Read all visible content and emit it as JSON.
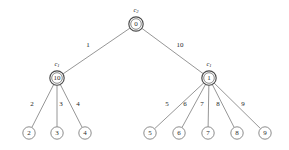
{
  "diagram": {
    "type": "weighted-tree",
    "background_color": "#ffffff",
    "edge_color": "#8a8a8a",
    "node_stroke_color": "#4a4a4a",
    "text_color": "#1e1e1e",
    "nodes": [
      {
        "id": "root",
        "label": "0",
        "x": 136,
        "y": 24,
        "r": 7.2,
        "style": "double",
        "cluster": "c",
        "cluster_sub": "2",
        "cluster_x": 136,
        "cluster_y": 9
      },
      {
        "id": "left",
        "label": "10",
        "x": 57,
        "y": 78,
        "r": 7.2,
        "style": "double",
        "cluster": "c",
        "cluster_sub": "1",
        "cluster_x": 57,
        "cluster_y": 63
      },
      {
        "id": "right",
        "label": "1",
        "x": 209,
        "y": 78,
        "r": 7.2,
        "style": "double",
        "cluster": "c",
        "cluster_sub": "1",
        "cluster_x": 209,
        "cluster_y": 63
      },
      {
        "id": "leaf2",
        "label": "2",
        "x": 29,
        "y": 133,
        "r": 6.2,
        "style": "single",
        "cluster": "",
        "cluster_sub": "",
        "cluster_x": 0,
        "cluster_y": 0
      },
      {
        "id": "leaf3",
        "label": "3",
        "x": 57,
        "y": 133,
        "r": 6.2,
        "style": "single",
        "cluster": "",
        "cluster_sub": "",
        "cluster_x": 0,
        "cluster_y": 0
      },
      {
        "id": "leaf4",
        "label": "4",
        "x": 85,
        "y": 133,
        "r": 6.2,
        "style": "single",
        "cluster": "",
        "cluster_sub": "",
        "cluster_x": 0,
        "cluster_y": 0
      },
      {
        "id": "leaf5",
        "label": "5",
        "x": 150,
        "y": 133,
        "r": 6.2,
        "style": "single",
        "cluster": "",
        "cluster_sub": "",
        "cluster_x": 0,
        "cluster_y": 0
      },
      {
        "id": "leaf6",
        "label": "6",
        "x": 179,
        "y": 133,
        "r": 6.2,
        "style": "single",
        "cluster": "",
        "cluster_sub": "",
        "cluster_x": 0,
        "cluster_y": 0
      },
      {
        "id": "leaf7",
        "label": "7",
        "x": 208,
        "y": 133,
        "r": 6.2,
        "style": "single",
        "cluster": "",
        "cluster_sub": "",
        "cluster_x": 0,
        "cluster_y": 0
      },
      {
        "id": "leaf8",
        "label": "8",
        "x": 237,
        "y": 133,
        "r": 6.2,
        "style": "single",
        "cluster": "",
        "cluster_sub": "",
        "cluster_x": 0,
        "cluster_y": 0
      },
      {
        "id": "leaf9",
        "label": "9",
        "x": 265,
        "y": 133,
        "r": 6.2,
        "style": "single",
        "cluster": "",
        "cluster_sub": "",
        "cluster_x": 0,
        "cluster_y": 0
      }
    ],
    "edges": [
      {
        "from": "root",
        "to": "left",
        "weight": "1",
        "wx": 88,
        "wy": 45
      },
      {
        "from": "root",
        "to": "right",
        "weight": "10",
        "wx": 180,
        "wy": 45
      },
      {
        "from": "left",
        "to": "leaf2",
        "weight": "2",
        "wx": 32,
        "wy": 104
      },
      {
        "from": "left",
        "to": "leaf3",
        "weight": "3",
        "wx": 61,
        "wy": 104
      },
      {
        "from": "left",
        "to": "leaf4",
        "weight": "4",
        "wx": 78,
        "wy": 104
      },
      {
        "from": "right",
        "to": "leaf5",
        "weight": "5",
        "wx": 167,
        "wy": 104
      },
      {
        "from": "right",
        "to": "leaf6",
        "weight": "6",
        "wx": 185,
        "wy": 104
      },
      {
        "from": "right",
        "to": "leaf7",
        "weight": "7",
        "wx": 202,
        "wy": 104
      },
      {
        "from": "right",
        "to": "leaf8",
        "weight": "8",
        "wx": 218,
        "wy": 104
      },
      {
        "from": "right",
        "to": "leaf9",
        "weight": "9",
        "wx": 243,
        "wy": 104
      }
    ]
  }
}
